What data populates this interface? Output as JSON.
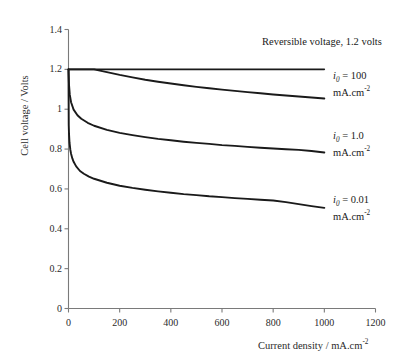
{
  "chart_data": {
    "type": "line",
    "title": "",
    "xlabel": "Current density / mA.cm",
    "xlabel_sup": "-2",
    "ylabel": "Cell voltage / Volts",
    "xlim": [
      0,
      1200
    ],
    "ylim": [
      0,
      1.4
    ],
    "grid": false,
    "legend_position": "right-inline-annotations",
    "xticks": [
      "0",
      "200",
      "400",
      "600",
      "800",
      "1000",
      "1200"
    ],
    "xtick_values": [
      0,
      200,
      400,
      600,
      800,
      1000,
      1200
    ],
    "yticks": [
      "0",
      "0.2",
      "0.4",
      "0.6",
      "0.8",
      "1",
      "1.2",
      "1.4"
    ],
    "ytick_values": [
      0,
      0.2,
      0.4,
      0.6,
      0.8,
      1.0,
      1.2,
      1.4
    ],
    "annotations": [
      {
        "name": "reversible-voltage-label",
        "text": "Reversible voltage, 1.2 volts",
        "x_px": 262,
        "y_px": 36
      }
    ],
    "series": [
      {
        "name": "reversible-voltage",
        "label": "Reversible voltage, 1.2 volts",
        "color": "#1a1a1a",
        "width": 1.6,
        "x": [
          0,
          100,
          200,
          300,
          400,
          500,
          600,
          700,
          800,
          900,
          1000
        ],
        "values": [
          1.2,
          1.2,
          1.2,
          1.2,
          1.2,
          1.2,
          1.2,
          1.2,
          1.2,
          1.2,
          1.2
        ]
      },
      {
        "name": "i0-100",
        "label_line1": "i0 = 100",
        "label_line2": "mA.cm",
        "label_sup": "-2",
        "i0": 100,
        "i0_units": "mA.cm-2",
        "color": "#1a1a1a",
        "width": 1.9,
        "label_x_px": 333,
        "label_y_px": 70,
        "x": [
          0,
          5,
          10,
          20,
          40,
          60,
          80,
          100,
          150,
          200,
          250,
          300,
          350,
          400,
          450,
          500,
          550,
          600,
          650,
          700,
          750,
          800,
          850,
          900,
          950,
          1000
        ],
        "values": [
          1.2,
          1.2,
          1.2,
          1.2,
          1.2,
          1.2,
          1.2,
          1.2,
          1.186,
          1.172,
          1.16,
          1.148,
          1.138,
          1.129,
          1.12,
          1.112,
          1.105,
          1.098,
          1.092,
          1.086,
          1.08,
          1.074,
          1.069,
          1.064,
          1.059,
          1.054
        ]
      },
      {
        "name": "i0-1.0",
        "label_line1": "i0 = 1.0",
        "label_line2": "mA.cm",
        "label_sup": "-2",
        "i0": 1.0,
        "i0_units": "mA.cm-2",
        "color": "#1a1a1a",
        "width": 1.9,
        "label_x_px": 333,
        "label_y_px": 130,
        "x": [
          0,
          2,
          5,
          10,
          20,
          35,
          50,
          75,
          100,
          150,
          200,
          250,
          300,
          350,
          400,
          450,
          500,
          550,
          600,
          650,
          700,
          750,
          800,
          850,
          900,
          950,
          1000
        ],
        "values": [
          1.2,
          1.122,
          1.073,
          1.035,
          0.998,
          0.97,
          0.952,
          0.932,
          0.917,
          0.896,
          0.881,
          0.87,
          0.86,
          0.851,
          0.844,
          0.837,
          0.831,
          0.826,
          0.82,
          0.816,
          0.811,
          0.807,
          0.803,
          0.799,
          0.796,
          0.79,
          0.783
        ]
      },
      {
        "name": "i0-0.01",
        "label_line1": "i0 = 0.01",
        "label_line2": "mA.cm",
        "label_sup": "-2",
        "i0": 0.01,
        "i0_units": "mA.cm-2",
        "color": "#1a1a1a",
        "width": 1.9,
        "label_x_px": 333,
        "label_y_px": 194,
        "x": [
          0,
          1,
          2,
          4,
          7,
          10,
          15,
          20,
          30,
          45,
          60,
          80,
          100,
          150,
          200,
          250,
          300,
          350,
          400,
          450,
          500,
          550,
          600,
          650,
          700,
          750,
          800,
          850,
          900,
          950,
          1000
        ],
        "values": [
          1.2,
          0.92,
          0.876,
          0.832,
          0.798,
          0.777,
          0.753,
          0.736,
          0.713,
          0.69,
          0.676,
          0.662,
          0.651,
          0.631,
          0.616,
          0.605,
          0.596,
          0.588,
          0.581,
          0.574,
          0.569,
          0.563,
          0.559,
          0.554,
          0.55,
          0.546,
          0.542,
          0.534,
          0.524,
          0.514,
          0.505
        ]
      }
    ]
  },
  "axes": {
    "axis_color": "#7a7a7a",
    "tick_color": "#7a7a7a"
  }
}
